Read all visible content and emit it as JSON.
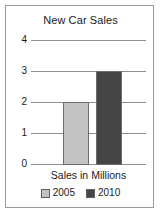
{
  "chart_data": {
    "type": "bar",
    "title": "New Car Sales",
    "xlabel": "Sales in Millions",
    "ylabel": "",
    "categories": [
      "Sales in Millions"
    ],
    "series": [
      {
        "name": "2005",
        "values": [
          2
        ],
        "color": "#c2c2c2"
      },
      {
        "name": "2010",
        "values": [
          3
        ],
        "color": "#454545"
      }
    ],
    "ylim": [
      0,
      4
    ],
    "yticks": [
      0,
      1,
      2,
      3,
      4
    ],
    "ytick_labels": [
      "0",
      "1",
      "2",
      "3",
      "4"
    ],
    "grid": true,
    "legend_position": "bottom",
    "legend_entries": [
      {
        "label": "2005",
        "color": "#c2c2c2"
      },
      {
        "label": "2010",
        "color": "#454545"
      }
    ]
  },
  "axis": {
    "tick_4": "4",
    "tick_3": "3",
    "tick_2": "2",
    "tick_1": "1",
    "tick_0": "0"
  },
  "legend": {
    "item_0_label": "2005",
    "item_1_label": "2010"
  },
  "colors": {
    "bar_2005": "#c2c2c2",
    "bar_2010": "#454545",
    "gridline": "#8d8d8d",
    "frame": "#9a9a9a",
    "text": "#1a1a1a",
    "background": "#ffffff"
  }
}
